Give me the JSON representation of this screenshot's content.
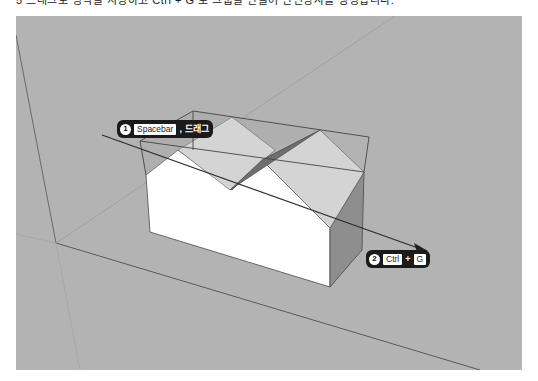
{
  "caption": {
    "text": "5 드래그로 영역을 지정하고 Ctrl + G 로 그룹을 만들어 단면상자를 생성합니다."
  },
  "viewport": {
    "background": "#b3b3b3",
    "scene": "section-box-over-box-with-roof"
  },
  "callouts": [
    {
      "number": "1",
      "key": "Spacebar",
      "separator": ",",
      "action": "드래그"
    },
    {
      "number": "2",
      "key_left": "Ctrl",
      "separator": "+",
      "key_right": "G"
    }
  ],
  "colors": {
    "viewport_bg": "#b3b3b3",
    "edge": "#4a4a4a",
    "white_face": "#ffffff",
    "light_face": "#d2d2d2",
    "mid_face": "#a8a8a8",
    "dark_face": "#6e6e6e",
    "callout_bg": "#1a1a1a"
  }
}
